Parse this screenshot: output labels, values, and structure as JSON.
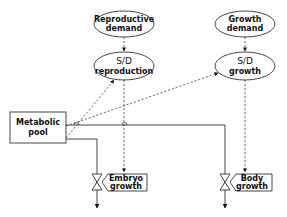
{
  "diagram": {
    "nodes": {
      "repro_demand": {
        "line1": "Reproductive",
        "line2": "demand"
      },
      "sd_repro": {
        "line1": "S/D",
        "line2": "reproduction"
      },
      "growth_demand": {
        "line1": "Growth",
        "line2": "demand"
      },
      "sd_growth": {
        "line1": "S/D",
        "line2": "growth"
      },
      "metabolic_pool": {
        "line1": "Metabolic",
        "line2": "pool"
      },
      "embryo_growth": {
        "line1": "Embryo",
        "line2": "growth"
      },
      "body_growth": {
        "line1": "Body",
        "line2": "growth"
      }
    },
    "edges": [
      {
        "from": "Reproductive demand",
        "to": "S/D reproduction",
        "style": "dashed"
      },
      {
        "from": "Growth demand",
        "to": "S/D growth",
        "style": "dashed"
      },
      {
        "from": "Metabolic pool",
        "to": "S/D reproduction",
        "style": "dashed"
      },
      {
        "from": "Metabolic pool",
        "to": "S/D growth",
        "style": "dashed"
      },
      {
        "from": "S/D reproduction",
        "to": "Embryo growth",
        "style": "dashed"
      },
      {
        "from": "S/D growth",
        "to": "Body growth",
        "style": "dashed"
      },
      {
        "from": "Metabolic pool",
        "to": "Embryo growth valve",
        "style": "solid"
      },
      {
        "from": "Metabolic pool",
        "to": "Body growth valve",
        "style": "solid"
      }
    ]
  }
}
